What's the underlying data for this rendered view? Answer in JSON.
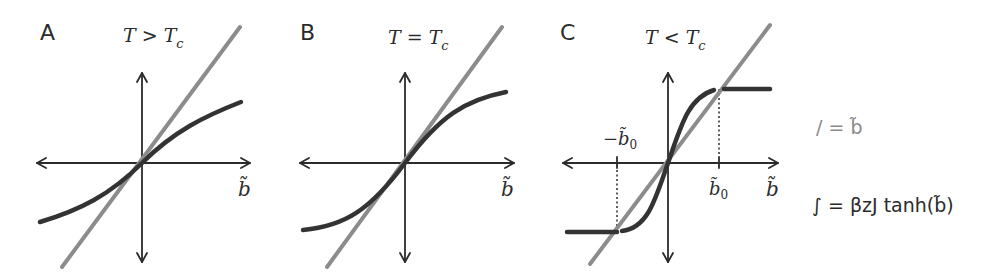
{
  "figure": {
    "colors": {
      "identity_line": "#8c8c8c",
      "tanh_curve": "#333333",
      "axes": "#2b2b2b",
      "background": "#ffffff"
    },
    "panels": [
      {
        "label": "A",
        "title_main": "T > T",
        "title_sub": "c",
        "x_axis_label": "b̃",
        "regime": "above critical temperature"
      },
      {
        "label": "B",
        "title_main": "T = T",
        "title_sub": "c",
        "x_axis_label": "b̃",
        "regime": "at critical temperature"
      },
      {
        "label": "C",
        "title_main": "T < T",
        "title_sub": "c",
        "x_axis_label": "b̃",
        "regime": "below critical temperature",
        "neg_root_main": "−b̃",
        "neg_root_sub": "0",
        "pos_root_main": "b̃",
        "pos_root_sub": "0"
      }
    ],
    "legend": [
      {
        "icon": "straight-line-icon",
        "symbol": "/",
        "text": "/ = b̃",
        "color": "#8c8c8c"
      },
      {
        "icon": "curve-icon",
        "symbol": "∫",
        "text": "∫ = βzJ tanh(b̃)",
        "color": "#333333"
      }
    ]
  }
}
